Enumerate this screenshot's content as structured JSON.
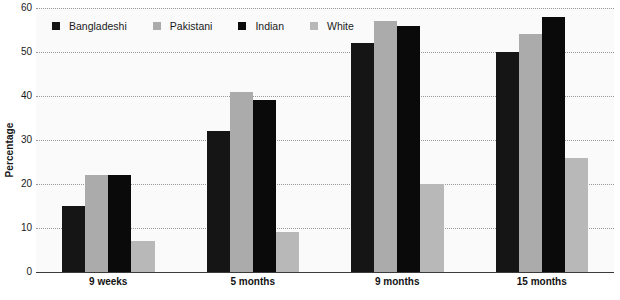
{
  "chart_data": {
    "type": "bar",
    "title": "",
    "subtitle": "",
    "xlabel": "",
    "ylabel": "Percentage",
    "categories": [
      "9 weeks",
      "5 months",
      "9 months",
      "15 months"
    ],
    "series": [
      {
        "name": "Bangladeshi",
        "color": "#151515",
        "values": [
          15,
          32,
          52,
          50
        ]
      },
      {
        "name": "Pakistani",
        "color": "#ababab",
        "values": [
          22,
          41,
          57,
          54
        ]
      },
      {
        "name": "Indian",
        "color": "#0a0a0a",
        "values": [
          22,
          39,
          56,
          58
        ]
      },
      {
        "name": "White",
        "color": "#b8b8b8",
        "values": [
          7,
          9,
          20,
          26
        ]
      }
    ],
    "ylim": [
      0,
      60
    ],
    "yticks": [
      0,
      10,
      20,
      30,
      40,
      50,
      60
    ],
    "ytick_labels": [
      "0",
      "10",
      "20",
      "30",
      "40",
      "50",
      "60"
    ],
    "grid": true,
    "grid_style": "dotted",
    "legend_position": "top-left",
    "bar_grouping": "grouped",
    "plot_background": "#fafafa"
  }
}
